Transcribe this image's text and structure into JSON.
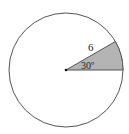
{
  "diagram": {
    "type": "circle-sector",
    "radius_label": "6",
    "angle_label": "30º",
    "radius_value": 6,
    "angle_degrees": 30,
    "colors": {
      "circle_stroke": "#555555",
      "sector_fill": "#b4b4b4",
      "background": "#ffffff"
    }
  }
}
